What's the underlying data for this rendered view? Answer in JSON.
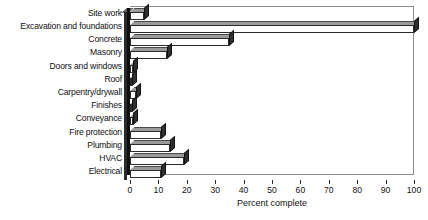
{
  "chart_data": {
    "type": "bar",
    "orientation": "horizontal",
    "title": "",
    "xlabel": "Percent complete",
    "ylabel": "",
    "xlim": [
      0,
      100
    ],
    "xticks": [
      0,
      10,
      20,
      30,
      40,
      50,
      60,
      70,
      80,
      90,
      100
    ],
    "xtick_labels": [
      "0",
      "10",
      "20",
      "30",
      "40",
      "50",
      "60",
      "70",
      "80",
      "90",
      "100"
    ],
    "grid": false,
    "legend": false,
    "style": "3d-horizontal-bars",
    "categories": [
      "Site work",
      "Excavation and foundations",
      "Concrete",
      "Masonry",
      "Doors and windows",
      "Roof",
      "Carpentry/drywall",
      "Finishes",
      "Conveyance",
      "Fire protection",
      "Plumbing",
      "HVAC",
      "Electrical"
    ],
    "values": [
      5,
      100,
      35,
      13,
      1,
      0,
      2,
      0,
      1,
      11,
      14,
      19,
      11
    ],
    "series": [
      {
        "name": "Percent complete",
        "values": [
          5,
          100,
          35,
          13,
          1,
          0,
          2,
          0,
          1,
          11,
          14,
          19,
          11
        ]
      }
    ]
  },
  "colors": {
    "bar_front": "#ffffff",
    "bar_top": "#9a9a9a",
    "bar_cap": "#2f2f2f",
    "axis": "#2b2b2b",
    "frame": "#8d8d8d",
    "text": "#111111",
    "background": "#ffffff"
  }
}
